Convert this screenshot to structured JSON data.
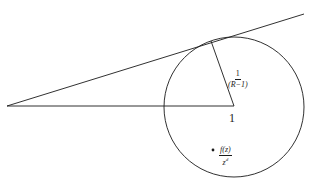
{
  "diagram": {
    "type": "geometry",
    "colors": {
      "stroke": "#1a1a1a",
      "background": "#ffffff"
    },
    "labels": {
      "radius": {
        "numerator": "1",
        "denominator": "(R−1)"
      },
      "center": "1",
      "point": {
        "numerator": "f(z)",
        "denominator": "z",
        "exponent": "d"
      }
    },
    "geometry": {
      "circle": {
        "cx": 234,
        "cy": 107,
        "r": 70
      },
      "vertex": {
        "x": 7,
        "y": 106
      },
      "tangent_point": {
        "x": 211,
        "y": 41
      },
      "tangent_line_end": {
        "x": 304,
        "y": 14
      },
      "center": {
        "x": 234,
        "y": 106
      },
      "marked_point": {
        "x": 213,
        "y": 150
      }
    }
  }
}
